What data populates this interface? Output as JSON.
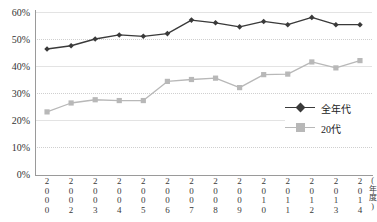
{
  "chart_data": {
    "type": "line",
    "title": "携帯インターネット利用率（単身）",
    "xlabel": "(年度)",
    "ylabel": "",
    "categories": [
      "2000",
      "2002",
      "2003",
      "2004",
      "2005",
      "2006",
      "2007",
      "2008",
      "2009",
      "2010",
      "2011",
      "2012",
      "2013",
      "2014"
    ],
    "ylim": [
      0,
      60
    ],
    "yticks": [
      "0%",
      "10%",
      "20%",
      "30%",
      "40%",
      "50%",
      "60%"
    ],
    "ytick_values": [
      0,
      10,
      20,
      30,
      40,
      50,
      60
    ],
    "grid": true,
    "legend_position": "right-middle",
    "series": [
      {
        "name": "全年代",
        "color": "#3a3a3a",
        "marker": "diamond",
        "values": [
          46.3,
          47.5,
          50.0,
          51.5,
          51.0,
          52.0,
          57.0,
          56.0,
          54.5,
          56.5,
          55.3,
          58.0,
          55.3,
          55.3
        ]
      },
      {
        "name": "20代",
        "color": "#b8b8b8",
        "marker": "square",
        "values": [
          23.0,
          26.3,
          27.5,
          27.2,
          27.2,
          34.3,
          35.0,
          35.5,
          32.0,
          36.8,
          37.0,
          41.5,
          39.3,
          42.0
        ]
      }
    ]
  },
  "axis_unit_chars": [
    "(",
    "年",
    "度",
    ")"
  ],
  "colors": {
    "series_all_ages": "#3a3a3a",
    "series_twenties": "#b8b8b8",
    "grid": "#cfcfcf",
    "axis": "#9a9a9a",
    "text": "#333333"
  }
}
